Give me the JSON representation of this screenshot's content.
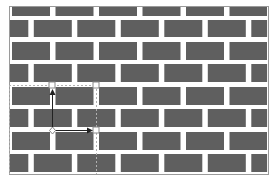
{
  "diagram": {
    "type": "brick-pattern-with-selection-gizmo",
    "colors": {
      "background": "#ffffff",
      "brick": "#5f5f5f",
      "frame": "#9a9a9a",
      "selection": "#b0b0b0",
      "gizmo": "#222222"
    },
    "frame": {
      "x": 9,
      "y": 6,
      "width": 259,
      "height": 168
    },
    "rows": [
      {
        "y": 7,
        "h": 9,
        "offset": "A"
      },
      {
        "y": 20,
        "h": 17,
        "offset": "B"
      },
      {
        "y": 42,
        "h": 18,
        "offset": "A"
      },
      {
        "y": 64,
        "h": 18,
        "offset": "B"
      },
      {
        "y": 87,
        "h": 18,
        "offset": "A"
      },
      {
        "y": 109,
        "h": 18,
        "offset": "B"
      },
      {
        "y": 132,
        "h": 18,
        "offset": "A"
      },
      {
        "y": 154,
        "h": 18,
        "offset": "B"
      }
    ],
    "brick_width": 38,
    "brick_pitch": 43.5,
    "selection": {
      "top_line_y": 85,
      "left_x": 9,
      "right_x": 96,
      "bottom_y": 174,
      "handles": [
        {
          "x": 52,
          "y": 85
        },
        {
          "x": 96,
          "y": 85
        },
        {
          "x": 96,
          "y": 130
        }
      ]
    },
    "gizmo": {
      "origin": {
        "x": 52,
        "y": 130
      },
      "up_arrow_end": {
        "x": 52,
        "y": 90
      },
      "right_arrow_end": {
        "x": 92,
        "y": 130
      }
    }
  }
}
